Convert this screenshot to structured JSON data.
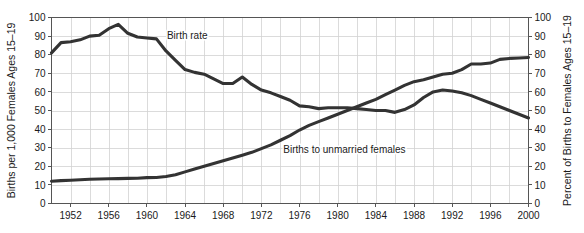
{
  "chart_data": {
    "type": "line",
    "title": "",
    "subtitle": "",
    "xlabel": "",
    "ylabel": "Births per 1,000 Females Ages 15–19",
    "y2label": "Percent of Births to Females Ages 15–19",
    "grid": true,
    "legend_position": "inline-annotations",
    "xlim": [
      1950,
      2000
    ],
    "ylim": [
      0,
      100
    ],
    "y2lim": [
      0,
      100
    ],
    "x_tick_labels": [
      "1952",
      "1956",
      "1960",
      "1964",
      "1968",
      "1972",
      "1976",
      "1980",
      "1984",
      "1988",
      "1992",
      "1996",
      "2000"
    ],
    "x_ticks": [
      1952,
      1956,
      1960,
      1964,
      1968,
      1972,
      1976,
      1980,
      1984,
      1988,
      1992,
      1996,
      2000
    ],
    "x_minor_ticks": [
      1950,
      1954,
      1958,
      1962,
      1966,
      1970,
      1974,
      1978,
      1982,
      1986,
      1990,
      1994,
      1998
    ],
    "y_tick_labels": [
      "0",
      "10",
      "20",
      "30",
      "40",
      "50",
      "60",
      "70",
      "80",
      "90",
      "100"
    ],
    "y_ticks": [
      0,
      10,
      20,
      30,
      40,
      50,
      60,
      70,
      80,
      90,
      100
    ],
    "y2_tick_labels": [
      "0",
      "10",
      "20",
      "30",
      "40",
      "50",
      "60",
      "70",
      "80",
      "90",
      "100"
    ],
    "y2_ticks": [
      0,
      10,
      20,
      30,
      40,
      50,
      60,
      70,
      80,
      90,
      100
    ],
    "series": [
      {
        "name": "Birth rate",
        "axis": "left",
        "color": "#333333",
        "annotation": "Birth rate",
        "annotation_x": 1962.1,
        "annotation_y": 88.5,
        "x": [
          1950,
          1951,
          1952,
          1953,
          1954,
          1955,
          1956,
          1957,
          1958,
          1959,
          1960,
          1961,
          1962,
          1963,
          1964,
          1965,
          1966,
          1967,
          1968,
          1969,
          1970,
          1971,
          1972,
          1973,
          1974,
          1975,
          1976,
          1977,
          1978,
          1979,
          1980,
          1981,
          1982,
          1983,
          1984,
          1985,
          1986,
          1987,
          1988,
          1989,
          1990,
          1991,
          1992,
          1993,
          1994,
          1995,
          1996,
          1997,
          1998,
          1999,
          2000
        ],
        "values": [
          81.0,
          86.5,
          87.0,
          88.0,
          90.0,
          90.5,
          94.0,
          96.3,
          91.5,
          89.5,
          89.0,
          88.5,
          82.0,
          77.0,
          72.0,
          70.5,
          69.5,
          67.0,
          64.5,
          64.5,
          68.0,
          64.0,
          61.0,
          59.5,
          57.5,
          55.5,
          52.5,
          52.0,
          51.0,
          51.5,
          51.5,
          51.5,
          51.0,
          50.5,
          50.0,
          50.0,
          49.0,
          50.5,
          53.0,
          57.0,
          60.0,
          61.0,
          60.5,
          59.5,
          58.0,
          56.0,
          54.0,
          52.0,
          50.0,
          48.0,
          46.0
        ]
      },
      {
        "name": "Births to unmarried females",
        "axis": "right",
        "color": "#333333",
        "annotation": "Births to unmarried females",
        "annotation_x": 1974.3,
        "annotation_y": 27.0,
        "x": [
          1950,
          1951,
          1952,
          1953,
          1954,
          1955,
          1956,
          1957,
          1958,
          1959,
          1960,
          1961,
          1962,
          1963,
          1964,
          1965,
          1966,
          1967,
          1968,
          1969,
          1970,
          1971,
          1972,
          1973,
          1974,
          1975,
          1976,
          1977,
          1978,
          1979,
          1980,
          1981,
          1982,
          1983,
          1984,
          1985,
          1986,
          1987,
          1988,
          1989,
          1990,
          1991,
          1992,
          1993,
          1994,
          1995,
          1996,
          1997,
          1998,
          1999,
          2000
        ],
        "values": [
          12.0,
          12.3,
          12.5,
          12.8,
          13.0,
          13.2,
          13.3,
          13.4,
          13.5,
          13.6,
          13.9,
          14.0,
          14.5,
          15.5,
          17.0,
          18.5,
          20.0,
          21.5,
          23.0,
          24.5,
          26.0,
          27.5,
          29.5,
          31.5,
          34.0,
          36.5,
          39.5,
          42.0,
          44.0,
          46.0,
          48.0,
          50.0,
          52.0,
          54.0,
          56.0,
          58.5,
          61.0,
          63.5,
          65.5,
          66.5,
          68.0,
          69.5,
          70.0,
          72.0,
          75.0,
          75.0,
          75.5,
          77.5,
          78.0,
          78.2,
          78.5
        ]
      }
    ]
  }
}
